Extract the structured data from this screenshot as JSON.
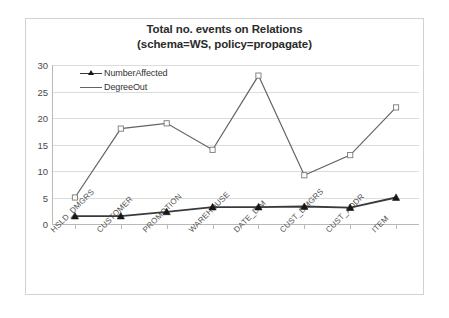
{
  "chart_data": {
    "type": "line",
    "title": "Total no. events on Relations (schema=WS, policy=propagate)",
    "title_line1": "Total no. events on Relations",
    "title_line2": "(schema=WS, policy=propagate)",
    "xlabel": "",
    "ylabel": "",
    "ylim": [
      0,
      30
    ],
    "yticks": [
      0,
      5,
      10,
      15,
      20,
      25,
      30
    ],
    "grid": true,
    "legend_position": "top-left",
    "categories": [
      "HSLD_DMGRS",
      "CUSTOMER",
      "PROMOTION",
      "WAREHOUSE",
      "DATE_DIM",
      "CUST_DMGRS",
      "CUST_ADDR",
      "ITEM"
    ],
    "series": [
      {
        "name": "NumberAffected",
        "marker": "triangle",
        "color": "#3a3a3a",
        "values": [
          1.5,
          1.5,
          2.3,
          3.2,
          3.2,
          3.3,
          3.1,
          5.0
        ]
      },
      {
        "name": "DegreeOut",
        "marker": "square",
        "color": "#636363",
        "values": [
          5,
          18,
          19,
          14,
          28,
          9.2,
          13,
          22
        ]
      }
    ]
  },
  "legend": {
    "items": [
      {
        "label": "NumberAffected"
      },
      {
        "label": "DegreeOut"
      }
    ]
  },
  "colors": {
    "grid": "#dcdcdc",
    "axis": "#b9b9b9",
    "text": "#4a4a4a",
    "frame": "#d2d2d2"
  }
}
